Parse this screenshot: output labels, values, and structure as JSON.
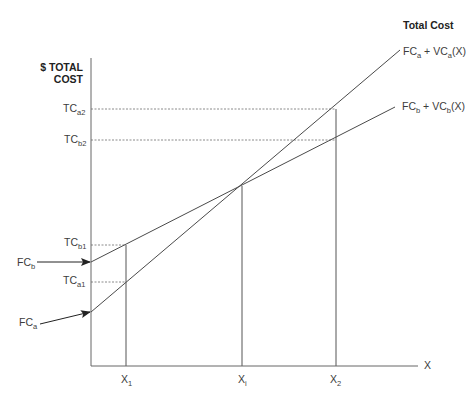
{
  "title": "Total Cost",
  "y_axis": {
    "label_line1": "$ TOTAL",
    "label_line2": "COST"
  },
  "x_axis": {
    "label": "X"
  },
  "y_ticks": [
    {
      "id": "tca2",
      "base": "TC",
      "sub": "a2",
      "y": 109
    },
    {
      "id": "tcb2",
      "base": "TC",
      "sub": "b2",
      "y": 140
    },
    {
      "id": "tcb1",
      "base": "TC",
      "sub": "b1",
      "y": 245
    },
    {
      "id": "tca1",
      "base": "TC",
      "sub": "a1",
      "y": 282
    }
  ],
  "x_ticks": [
    {
      "id": "x1",
      "base": "X",
      "sub": "1",
      "x": 126
    },
    {
      "id": "xi",
      "base": "X",
      "sub": "i",
      "x": 242
    },
    {
      "id": "x2",
      "base": "X",
      "sub": "2",
      "x": 336
    }
  ],
  "fixed_costs": [
    {
      "id": "fcb",
      "base": "FC",
      "sub": "b",
      "y": 262
    },
    {
      "id": "fca",
      "base": "FC",
      "sub": "a",
      "y": 312
    }
  ],
  "curves": [
    {
      "id": "a",
      "label_base1": "FC",
      "label_sub1": "a",
      "label_mid": " + VC",
      "label_sub2": "a",
      "label_end": "(X)",
      "x0": 91,
      "y0": 312,
      "x1": 400,
      "y1": 50
    },
    {
      "id": "b",
      "label_base1": "FC",
      "label_sub1": "b",
      "label_mid": " + VC",
      "label_sub2": "b",
      "label_end": "(X)",
      "x0": 91,
      "y0": 262,
      "x1": 395,
      "y1": 107
    }
  ],
  "colors": {
    "line": "#4a4a4a",
    "axis": "#666666",
    "dotted": "#8a8a8a",
    "text": "#3c3c3c"
  }
}
